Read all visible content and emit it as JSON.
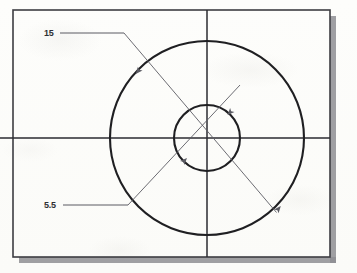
{
  "document": {
    "kind": "scanned-technical-drawing",
    "description": "Orthographic view of two concentric circles with diameter dimensions"
  },
  "frame": {
    "name": "drawing-border",
    "x": 13,
    "y": 10,
    "width": 317,
    "height": 247,
    "stroke_color": "#3d3d42",
    "stroke_width": 1.6,
    "shadow_color": "#8e8e93",
    "shadow_offset": 6
  },
  "background": {
    "paper_color": "#fdfdfb",
    "outside_color": "#ffffff"
  },
  "geometry": {
    "center": {
      "x": 207,
      "y": 138
    },
    "circles": [
      {
        "name": "outer-circle",
        "radius": 97,
        "diameter_value": "15",
        "stroke_color": "#1f1f22",
        "stroke_width": 2.1
      },
      {
        "name": "inner-circle",
        "radius": 33,
        "diameter_value": "5.5",
        "stroke_color": "#1f1f22",
        "stroke_width": 2.1
      }
    ],
    "centerlines": [
      {
        "name": "horizontal-centerline",
        "x1": 0,
        "y1": 138,
        "x2": 330,
        "y2": 138,
        "stroke_color": "#2b2b30",
        "stroke_width": 1.5
      },
      {
        "name": "vertical-centerline",
        "x1": 207,
        "y1": 10,
        "x2": 207,
        "y2": 257,
        "stroke_color": "#2b2b30",
        "stroke_width": 1.5
      }
    ]
  },
  "dimensions": [
    {
      "name": "diameter-15",
      "label": "15",
      "value": 15,
      "label_x": 44,
      "label_y": 28,
      "leader": {
        "x1": 60,
        "y1": 33,
        "x2": 124,
        "y2": 33
      },
      "dim_line": {
        "x1": 124,
        "y1": 33,
        "x2": 276,
        "y2": 212
      },
      "arrows": [
        {
          "x": 138,
          "y": 66,
          "angle": 130
        },
        {
          "x": 270,
          "y": 205,
          "angle": 130
        }
      ],
      "stroke_color": "#5b5b63",
      "stroke_width": 0.9
    },
    {
      "name": "diameter-5-5",
      "label": "5.5",
      "value": 5.5,
      "label_x": 44,
      "label_y": 200,
      "leader": {
        "x1": 63,
        "y1": 205,
        "x2": 128,
        "y2": 205
      },
      "dim_line": {
        "x1": 128,
        "y1": 205,
        "x2": 240,
        "y2": 85
      },
      "arrows": [
        {
          "x": 184,
          "y": 157,
          "angle": 313
        },
        {
          "x": 231,
          "y": 110,
          "angle": 313
        }
      ],
      "stroke_color": "#5b5b63",
      "stroke_width": 0.9
    }
  ],
  "colors": {
    "object_line": "#1f1f22",
    "center_line": "#2b2b30",
    "dimension_line": "#5b5b63",
    "border": "#3d3d42",
    "shadow": "#8e8e93",
    "text": "#2f2f33"
  }
}
